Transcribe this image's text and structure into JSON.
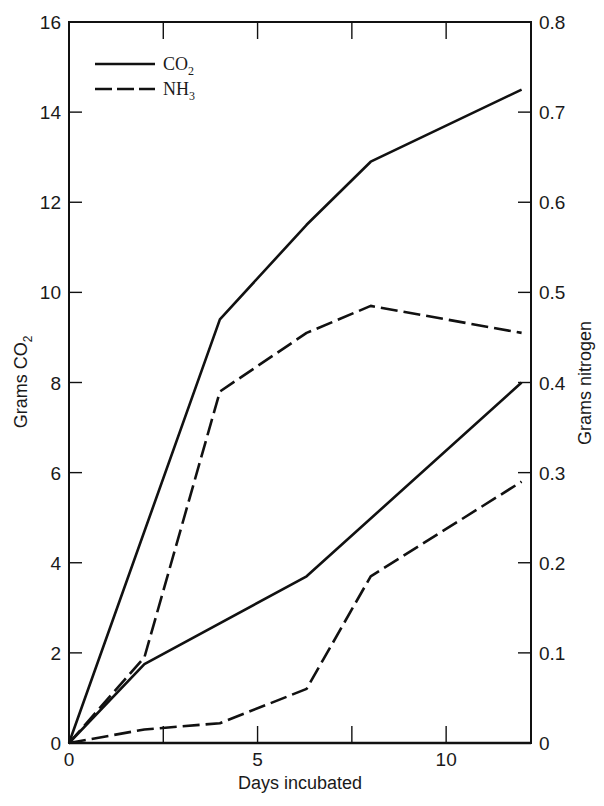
{
  "chart_data": {
    "type": "line",
    "title": "",
    "xlabel": "Days incubated",
    "ylabel": "Grams CO2",
    "ylabel_right": "Grams nitrogen",
    "xlim": [
      0,
      12.25
    ],
    "ylim": [
      0,
      16
    ],
    "ylim_right": [
      0,
      0.8
    ],
    "x_ticks": [
      "0",
      "5",
      "10"
    ],
    "y_ticks": [
      "0",
      "2",
      "4",
      "6",
      "8",
      "10",
      "12",
      "14",
      "16"
    ],
    "y_ticks_right": [
      "0",
      "0.1",
      "0.2",
      "0.3",
      "0.4",
      "0.5",
      "0.6",
      "0.7",
      "0.8"
    ],
    "grid": false,
    "legend_position": "upper-left",
    "legend": [
      {
        "label": "CO",
        "sub": "2",
        "style": "solid"
      },
      {
        "label": "NH",
        "sub": "3",
        "style": "dashed"
      }
    ],
    "series": [
      {
        "name": "CO2 (upper)",
        "style": "solid",
        "axis": "left",
        "x": [
          0,
          4,
          6.3,
          8,
          12
        ],
        "values": [
          0,
          9.4,
          11.5,
          12.9,
          14.5
        ]
      },
      {
        "name": "NH3 (upper)",
        "style": "dashed",
        "axis": "right",
        "x": [
          0,
          2,
          4,
          6.3,
          8,
          12
        ],
        "values": [
          0,
          0.095,
          0.39,
          0.455,
          0.485,
          0.455
        ]
      },
      {
        "name": "CO2 (lower)",
        "style": "solid",
        "axis": "left",
        "x": [
          0,
          2,
          6.3,
          12
        ],
        "values": [
          0,
          1.75,
          3.7,
          8.0
        ]
      },
      {
        "name": "NH3 (lower)",
        "style": "dashed",
        "axis": "right",
        "x": [
          0,
          2,
          4,
          6.3,
          8,
          12
        ],
        "values": [
          0,
          0.015,
          0.022,
          0.06,
          0.185,
          0.29
        ]
      }
    ]
  },
  "labels": {
    "xlabel": "Days incubated",
    "ylabel_left_main": "Grams CO",
    "ylabel_left_sub": "2",
    "ylabel_right": "Grams nitrogen",
    "legend_co2": "CO",
    "legend_co2_sub": "2",
    "legend_nh3": "NH",
    "legend_nh3_sub": "3"
  }
}
